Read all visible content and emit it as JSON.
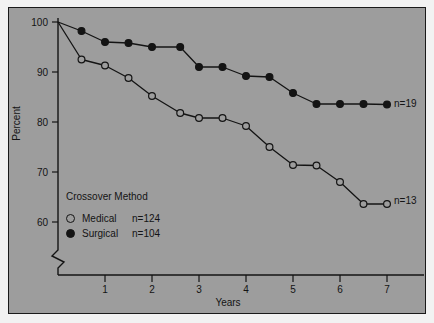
{
  "chart_data": {
    "type": "line",
    "title": "",
    "subtitle": "",
    "xlabel": "Years",
    "ylabel": "Percent",
    "xlim": [
      0,
      7.6
    ],
    "ylim": [
      58,
      100
    ],
    "y_axis_break": true,
    "grid": false,
    "xticks": [
      "1",
      "2",
      "3",
      "4",
      "5",
      "6",
      "7"
    ],
    "xtick_values": [
      1,
      2,
      3,
      4,
      5,
      6,
      7
    ],
    "yticks": [
      "60",
      "70",
      "80",
      "90",
      "100"
    ],
    "ytick_values": [
      60,
      70,
      80,
      90,
      100
    ],
    "legend_position": "lower-left-inside",
    "legend_title": "Crossover Method",
    "series": [
      {
        "name": "Medical",
        "n_label": "n=124",
        "marker": "open-circle",
        "end_annotation": "n=13",
        "x": [
          0,
          0.5,
          1.0,
          1.5,
          2.0,
          2.6,
          3.0,
          3.5,
          4.0,
          4.5,
          5.0,
          5.5,
          6.0,
          6.5,
          7.0
        ],
        "y": [
          100,
          92.5,
          91.3,
          88.8,
          85.2,
          81.8,
          80.8,
          80.8,
          79.2,
          75.0,
          71.4,
          71.3,
          68.0,
          63.6,
          63.6
        ]
      },
      {
        "name": "Surgical",
        "n_label": "n=104",
        "marker": "filled-circle",
        "end_annotation": "n=19",
        "x": [
          0,
          0.5,
          1.0,
          1.5,
          2.0,
          2.6,
          3.0,
          3.5,
          4.0,
          4.5,
          5.0,
          5.5,
          6.0,
          6.5,
          7.0
        ],
        "y": [
          100,
          98.2,
          96.0,
          95.8,
          95.0,
          95.0,
          91.0,
          91.0,
          89.2,
          89.0,
          85.8,
          83.6,
          83.6,
          83.6,
          83.5
        ]
      }
    ]
  },
  "axes": {
    "y_title": "Percent",
    "x_title": "Years"
  },
  "legend": {
    "title": "Crossover Method",
    "rows": [
      {
        "marker": "open-circle",
        "label": "Medical",
        "count": "n=124"
      },
      {
        "marker": "filled-circle",
        "label": "Surgical",
        "count": "n=104"
      }
    ]
  },
  "annotations": {
    "surgical_end": "n=19",
    "medical_end": "n=13"
  },
  "colors": {
    "background": "#9d9d9d",
    "ink": "#141414",
    "page": "#f2f2f2"
  }
}
